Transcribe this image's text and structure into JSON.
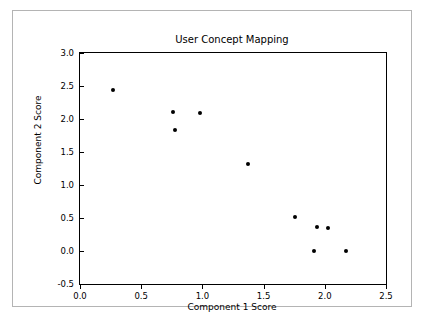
{
  "chart_data": {
    "type": "scatter",
    "title": "User Concept Mapping",
    "xlabel": "Component 1 Score",
    "ylabel": "Component 2 Score",
    "xlim": [
      0.0,
      2.5
    ],
    "ylim": [
      -0.5,
      3.0
    ],
    "xticks": [
      "0.0",
      "0.5",
      "1.0",
      "1.5",
      "2.0",
      "2.5"
    ],
    "xtick_values": [
      0.0,
      0.5,
      1.0,
      1.5,
      2.0,
      2.5
    ],
    "yticks": [
      "-0.5",
      "0.0",
      "0.5",
      "1.0",
      "1.5",
      "2.0",
      "2.5",
      "3.0"
    ],
    "ytick_values": [
      -0.5,
      0.0,
      0.5,
      1.0,
      1.5,
      2.0,
      2.5,
      3.0
    ],
    "grid": false,
    "legend": null,
    "marker_color": "#000000",
    "marker": "circle",
    "points": [
      {
        "x": 0.27,
        "y": 2.44
      },
      {
        "x": 0.76,
        "y": 2.11
      },
      {
        "x": 0.78,
        "y": 1.84
      },
      {
        "x": 0.98,
        "y": 2.09
      },
      {
        "x": 1.37,
        "y": 1.32
      },
      {
        "x": 1.76,
        "y": 0.52
      },
      {
        "x": 1.94,
        "y": 0.37
      },
      {
        "x": 2.03,
        "y": 0.35
      },
      {
        "x": 1.91,
        "y": 0.0
      },
      {
        "x": 2.17,
        "y": 0.0
      }
    ]
  },
  "figure": {
    "border_color": "#b4b4b4",
    "background": "#ffffff",
    "axis_color": "#000000"
  }
}
